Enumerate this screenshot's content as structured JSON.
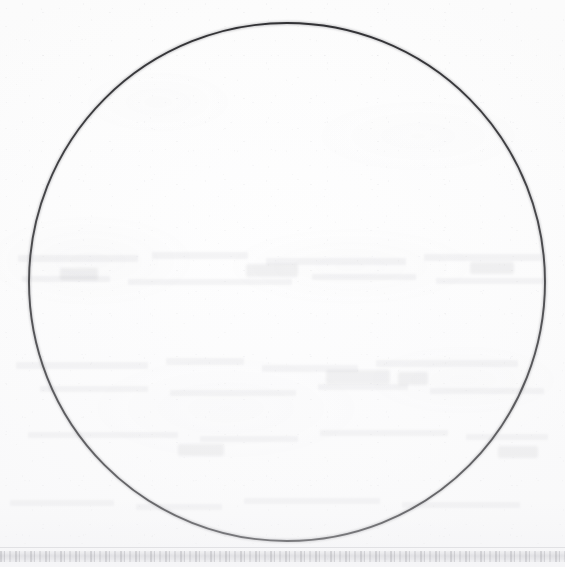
{
  "page": {
    "kind": "scanned-document-page",
    "width": 565,
    "height": 567,
    "background_color": "#fdfdfd",
    "ink_color": "#303033",
    "visible_text": "",
    "caption": "",
    "page_number": ""
  },
  "figure": {
    "name": "circle",
    "shape": "circle",
    "stroke_color": "#303033",
    "stroke_width_px": 2,
    "fill": "none",
    "center_x": 287,
    "center_y": 282,
    "radius_x": 258,
    "radius_y": 259,
    "bounds": {
      "left": 29,
      "top": 23,
      "right": 545,
      "bottom": 541
    },
    "label": ""
  },
  "artifacts": {
    "bottom_band": {
      "name": "scan-edge-band",
      "top": 551,
      "height": 11,
      "color": "#7a7a82",
      "legible_text": ""
    },
    "showthrough": {
      "name": "verso-show-through",
      "description": "faint illegible text bleeding through from the reverse side of the sheet",
      "color": "#80808a",
      "legible_text": "",
      "lines": [
        {
          "x": 18,
          "y": 255,
          "w": 120,
          "h": 7
        },
        {
          "x": 152,
          "y": 252,
          "w": 96,
          "h": 7
        },
        {
          "x": 266,
          "y": 258,
          "w": 140,
          "h": 7
        },
        {
          "x": 424,
          "y": 254,
          "w": 118,
          "h": 7
        },
        {
          "x": 22,
          "y": 276,
          "w": 88,
          "h": 6
        },
        {
          "x": 128,
          "y": 279,
          "w": 164,
          "h": 6
        },
        {
          "x": 312,
          "y": 274,
          "w": 104,
          "h": 6
        },
        {
          "x": 436,
          "y": 278,
          "w": 110,
          "h": 6
        },
        {
          "x": 16,
          "y": 362,
          "w": 132,
          "h": 7
        },
        {
          "x": 166,
          "y": 358,
          "w": 78,
          "h": 7
        },
        {
          "x": 262,
          "y": 365,
          "w": 96,
          "h": 7
        },
        {
          "x": 376,
          "y": 360,
          "w": 142,
          "h": 7
        },
        {
          "x": 40,
          "y": 386,
          "w": 108,
          "h": 6
        },
        {
          "x": 170,
          "y": 390,
          "w": 126,
          "h": 6
        },
        {
          "x": 318,
          "y": 384,
          "w": 90,
          "h": 6
        },
        {
          "x": 430,
          "y": 388,
          "w": 114,
          "h": 6
        },
        {
          "x": 28,
          "y": 432,
          "w": 150,
          "h": 6
        },
        {
          "x": 200,
          "y": 436,
          "w": 98,
          "h": 6
        },
        {
          "x": 320,
          "y": 430,
          "w": 128,
          "h": 6
        },
        {
          "x": 466,
          "y": 434,
          "w": 82,
          "h": 6
        },
        {
          "x": 10,
          "y": 500,
          "w": 104,
          "h": 6
        },
        {
          "x": 136,
          "y": 504,
          "w": 86,
          "h": 6
        },
        {
          "x": 244,
          "y": 498,
          "w": 136,
          "h": 6
        },
        {
          "x": 402,
          "y": 502,
          "w": 118,
          "h": 6
        }
      ],
      "words": [
        {
          "x": 326,
          "y": 370,
          "w": 64,
          "h": 14
        },
        {
          "x": 398,
          "y": 372,
          "w": 30,
          "h": 13
        },
        {
          "x": 246,
          "y": 264,
          "w": 52,
          "h": 13
        },
        {
          "x": 470,
          "y": 262,
          "w": 44,
          "h": 12
        },
        {
          "x": 60,
          "y": 268,
          "w": 38,
          "h": 12
        },
        {
          "x": 178,
          "y": 444,
          "w": 46,
          "h": 12
        },
        {
          "x": 498,
          "y": 446,
          "w": 40,
          "h": 12
        }
      ]
    }
  }
}
